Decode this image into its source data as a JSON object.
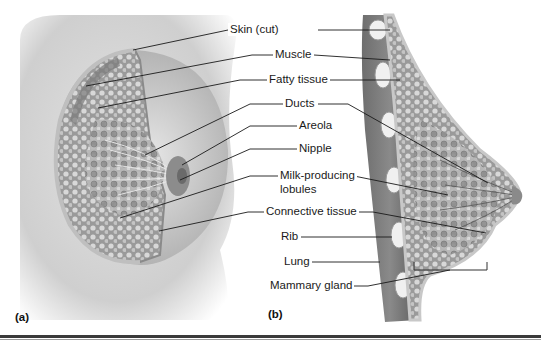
{
  "figure": {
    "panels": [
      {
        "id": "a",
        "label": "(a)"
      },
      {
        "id": "b",
        "label": "(b)"
      }
    ],
    "labels": [
      {
        "key": "skin",
        "text": "Skin (cut)"
      },
      {
        "key": "muscle",
        "text": "Muscle"
      },
      {
        "key": "fatty",
        "text": "Fatty tissue"
      },
      {
        "key": "ducts",
        "text": "Ducts"
      },
      {
        "key": "areola",
        "text": "Areola"
      },
      {
        "key": "nipple",
        "text": "Nipple"
      },
      {
        "key": "lobules1",
        "text": "Milk-producing"
      },
      {
        "key": "lobules2",
        "text": "lobules"
      },
      {
        "key": "connective",
        "text": "Connective tissue"
      },
      {
        "key": "rib",
        "text": "Rib"
      },
      {
        "key": "lung",
        "text": "Lung"
      },
      {
        "key": "mammary",
        "text": "Mammary gland"
      }
    ],
    "colors": {
      "background": "#ffffff",
      "skin_shading": "#bdbdbd",
      "tissue": "#9e9e9e",
      "leader_line": "#1a1a1a",
      "rule": "#3a3a3a"
    }
  }
}
